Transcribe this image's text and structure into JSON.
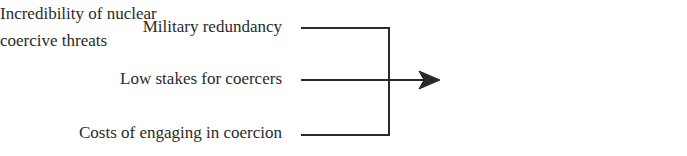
{
  "diagram": {
    "type": "convergent-causal-flow",
    "causes": [
      {
        "label": "Military redundancy"
      },
      {
        "label": "Low stakes for coercers"
      },
      {
        "label": "Costs of engaging in coercion"
      }
    ],
    "outcome": {
      "lines": [
        "Incredibility of nuclear",
        "coercive threats"
      ]
    },
    "colors": {
      "text": "#2a2a2a",
      "lines": "#2a2a2a",
      "background": "#ffffff"
    }
  }
}
